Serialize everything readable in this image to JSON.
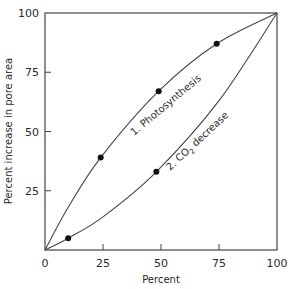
{
  "chart_data": {
    "type": "line",
    "title": "",
    "xlabel": "Percent",
    "ylabel": "Percent increase in pore area",
    "xlim": [
      0,
      100
    ],
    "ylim": [
      0,
      100
    ],
    "x_ticks": [
      0,
      25,
      50,
      75,
      100
    ],
    "y_ticks": [
      25,
      50,
      75,
      100
    ],
    "x_tick_labels": [
      "0",
      "25",
      "50",
      "75",
      "100"
    ],
    "y_tick_labels": [
      "25",
      "50",
      "75",
      "100"
    ],
    "grid": false,
    "legend": "none (curves labeled inline)",
    "series": [
      {
        "name": "1. Photosynthesis",
        "curve_shape": "concave",
        "curve": [
          [
            0,
            0
          ],
          [
            10,
            18
          ],
          [
            24,
            39
          ],
          [
            49,
            67
          ],
          [
            74,
            87
          ],
          [
            100,
            100
          ]
        ],
        "markers": [
          [
            24,
            39
          ],
          [
            49,
            67
          ],
          [
            74,
            87
          ]
        ]
      },
      {
        "name": "2. CO2 decrease",
        "curve_shape": "convex",
        "curve": [
          [
            0,
            0
          ],
          [
            10,
            5
          ],
          [
            25,
            14
          ],
          [
            48,
            33
          ],
          [
            75,
            63
          ],
          [
            100,
            100
          ]
        ],
        "markers": [
          [
            10,
            5
          ],
          [
            48,
            33
          ]
        ]
      }
    ]
  },
  "labels": {
    "xlabel": "Percent",
    "ylabel": "Percent increase in pore area",
    "series1": "1. Photosynthesis",
    "series2_prefix": "2. CO",
    "series2_sub": "2",
    "series2_suffix": " decrease",
    "origin": "0"
  }
}
